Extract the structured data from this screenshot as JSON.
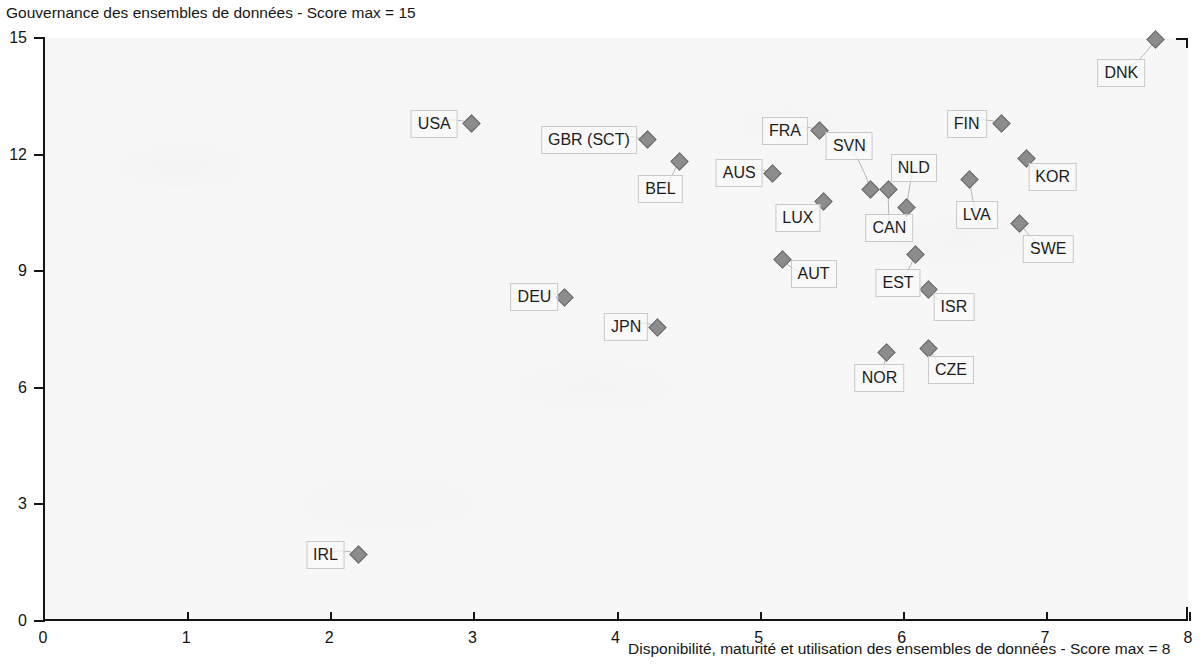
{
  "chart_data": {
    "type": "scatter",
    "title": "",
    "ylabel": "Gouvernance des ensembles de données - Score max = 15",
    "xlabel": "Disponibilité, maturité et utilisation des ensembles de données - Score max = 8",
    "xlim": [
      0,
      8
    ],
    "ylim": [
      0,
      15
    ],
    "xticks": [
      "0",
      "1",
      "2",
      "3",
      "4",
      "5",
      "6",
      "7",
      "8"
    ],
    "yticks": [
      "0",
      "3",
      "6",
      "9",
      "12",
      "15"
    ],
    "grid": false,
    "legend": null,
    "marker_color": "#8c8c8c",
    "plot_background": "#f7f7f7",
    "axis_color": "#141414",
    "points": [
      {
        "label": "DNK",
        "x": 7.76,
        "y": 14.95,
        "lx": 7.52,
        "ly": 14.1
      },
      {
        "label": "USA",
        "x": 2.98,
        "y": 12.79,
        "lx": 2.72,
        "ly": 12.8
      },
      {
        "label": "FIN",
        "x": 6.68,
        "y": 12.79,
        "lx": 6.44,
        "ly": 12.8
      },
      {
        "label": "FRA",
        "x": 5.41,
        "y": 12.61,
        "lx": 5.17,
        "ly": 12.62
      },
      {
        "label": "GBR (SCT)",
        "x": 4.21,
        "y": 12.38,
        "lx": 3.8,
        "ly": 12.38
      },
      {
        "label": "SVN",
        "x": 5.77,
        "y": 11.11,
        "lx": 5.62,
        "ly": 12.22
      },
      {
        "label": "KOR",
        "x": 6.86,
        "y": 11.89,
        "lx": 7.04,
        "ly": 11.43
      },
      {
        "label": "BEL",
        "x": 4.43,
        "y": 11.83,
        "lx": 4.3,
        "ly": 11.12
      },
      {
        "label": "NLD",
        "x": 6.02,
        "y": 10.65,
        "lx": 6.07,
        "ly": 11.65
      },
      {
        "label": "AUS",
        "x": 5.08,
        "y": 11.52,
        "lx": 4.85,
        "ly": 11.53
      },
      {
        "label": "LVA",
        "x": 6.46,
        "y": 11.35,
        "lx": 6.51,
        "ly": 10.44
      },
      {
        "label": "CAN",
        "x": 5.89,
        "y": 11.09,
        "lx": 5.9,
        "ly": 10.12
      },
      {
        "label": "LUX",
        "x": 5.44,
        "y": 10.8,
        "lx": 5.26,
        "ly": 10.36
      },
      {
        "label": "SWE",
        "x": 6.81,
        "y": 10.24,
        "lx": 7.01,
        "ly": 9.57
      },
      {
        "label": "EST",
        "x": 6.08,
        "y": 9.42,
        "lx": 5.96,
        "ly": 8.7
      },
      {
        "label": "AUT",
        "x": 5.15,
        "y": 9.29,
        "lx": 5.37,
        "ly": 8.93
      },
      {
        "label": "ISR",
        "x": 6.17,
        "y": 8.54,
        "lx": 6.35,
        "ly": 8.08
      },
      {
        "label": "DEU",
        "x": 3.63,
        "y": 8.33,
        "lx": 3.42,
        "ly": 8.34
      },
      {
        "label": "JPN",
        "x": 4.28,
        "y": 7.56,
        "lx": 4.06,
        "ly": 7.57
      },
      {
        "label": "CZE",
        "x": 6.17,
        "y": 7.02,
        "lx": 6.33,
        "ly": 6.45
      },
      {
        "label": "NOR",
        "x": 5.88,
        "y": 6.92,
        "lx": 5.83,
        "ly": 6.26
      },
      {
        "label": "IRL",
        "x": 2.19,
        "y": 1.7,
        "lx": 1.96,
        "ly": 1.71
      }
    ]
  }
}
